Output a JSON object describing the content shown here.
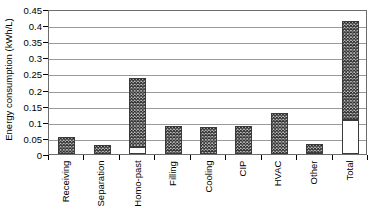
{
  "chart_data": {
    "type": "bar",
    "title": "",
    "xlabel": "",
    "ylabel": "Energy consumption (kWh/L)",
    "ylim": [
      0,
      0.45
    ],
    "ytick_labels": [
      "0",
      "0.05",
      "0.1",
      "0.15",
      "0.2",
      "0.25",
      "0.3",
      "0.35",
      "0.4",
      "0.45"
    ],
    "ytick_values": [
      0,
      0.05,
      0.1,
      0.15,
      0.2,
      0.25,
      0.3,
      0.35,
      0.4,
      0.45
    ],
    "grid": "horizontal",
    "legend": "none",
    "categories": [
      "Receiving",
      "Separation",
      "Homo-past",
      "Filling",
      "Cooling",
      "CIP",
      "HVAC",
      "Other",
      "Total"
    ],
    "values": [
      0.053,
      0.027,
      0.236,
      0.086,
      0.085,
      0.088,
      0.128,
      0.03,
      0.412
    ],
    "series": [
      {
        "name": "Lower (unhatched) portion",
        "values": [
          0,
          0,
          0.021,
          0,
          0,
          0,
          0,
          0,
          0.105
        ]
      },
      {
        "name": "Upper (hatched) portion",
        "values": [
          0.053,
          0.027,
          0.215,
          0.086,
          0.085,
          0.088,
          0.128,
          0.03,
          0.307
        ]
      }
    ],
    "bar_fill": "black-cross-hatch",
    "bar_edge_color": "#3a3a3a",
    "gridline_color": "#9a9a9a",
    "axis_color": "#6d6d6d",
    "background_color": "#ffffff"
  }
}
